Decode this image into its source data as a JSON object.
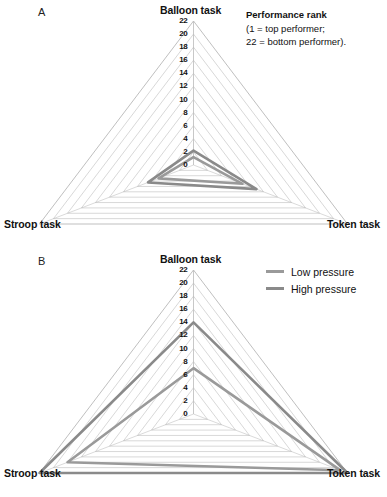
{
  "figure": {
    "panels": [
      {
        "letter": "A",
        "axes": [
          "Balloon task",
          "Stroop task",
          "Token task"
        ],
        "tick_labels": [
          "22",
          "20",
          "18",
          "16",
          "14",
          "12",
          "10",
          "8",
          "6",
          "4",
          "2",
          "0"
        ]
      },
      {
        "letter": "B",
        "axes": [
          "Balloon task",
          "Stroop task",
          "Token task"
        ],
        "tick_labels": [
          "22",
          "20",
          "18",
          "16",
          "14",
          "12",
          "10",
          "8",
          "6",
          "4",
          "2",
          "0"
        ]
      }
    ],
    "annotation": {
      "title": "Performance rank",
      "line1": "(1 = top performer;",
      "line2": "22 = bottom performer)."
    },
    "legend": {
      "items": [
        {
          "label": "Low pressure",
          "color": "#9a9a9a"
        },
        {
          "label": "High pressure",
          "color": "#8a8a8a"
        }
      ]
    },
    "colors": {
      "grid": "#b8b8b8",
      "spoke": "#bcbcbc",
      "series_low": "#9a9a9a",
      "series_high": "#8a8a8a",
      "text": "#111111",
      "background": "#ffffff"
    }
  },
  "chart_data": [
    {
      "type": "radar",
      "panel": "A",
      "title": "",
      "categories": [
        "Balloon task",
        "Token task",
        "Stroop task"
      ],
      "ylabel": "Performance rank",
      "ylim": [
        0,
        22
      ],
      "tick_step": 2,
      "grid": true,
      "legend_position": "none",
      "series": [
        {
          "name": "Low pressure",
          "values": [
            1.2,
            7.0,
            5.0
          ]
        },
        {
          "name": "High pressure",
          "values": [
            2.2,
            9.0,
            6.5
          ]
        }
      ]
    },
    {
      "type": "radar",
      "panel": "B",
      "title": "",
      "categories": [
        "Balloon task",
        "Token task",
        "Stroop task"
      ],
      "ylabel": "Performance rank",
      "ylim": [
        0,
        22
      ],
      "tick_step": 2,
      "grid": true,
      "legend_position": "top-right",
      "series": [
        {
          "name": "Low pressure",
          "values": [
            7.0,
            21.0,
            18.0
          ]
        },
        {
          "name": "High pressure",
          "values": [
            14.0,
            22.0,
            22.0
          ]
        }
      ]
    }
  ]
}
